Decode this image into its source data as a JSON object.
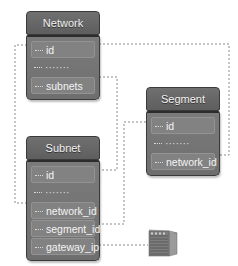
{
  "diagram": {
    "type": "entity-relationship",
    "colors": {
      "entity_fill": "#6e6e6e",
      "entity_border": "#3a3a3a",
      "text": "#f4f4f4",
      "link": "#888888",
      "background": "#ffffff"
    },
    "entities": [
      {
        "id": "network",
        "title": "Network",
        "fields": [
          "id",
          "·······",
          "subnets"
        ]
      },
      {
        "id": "segment",
        "title": "Segment",
        "fields": [
          "id",
          "·······",
          "network_id"
        ]
      },
      {
        "id": "subnet",
        "title": "Subnet",
        "fields": [
          "id",
          "·······",
          "network_id",
          "segment_id",
          "gateway_ip"
        ]
      }
    ],
    "links": [
      {
        "from": "Network.id",
        "to": "Subnet.network_id",
        "style": "dotted"
      },
      {
        "from": "Network.id",
        "to": "Segment.network_id",
        "style": "dotted"
      },
      {
        "from": "Network.subnets",
        "to": "Subnet.id",
        "style": "dotted"
      },
      {
        "from": "Segment.id",
        "to": "Subnet.segment_id",
        "style": "dotted"
      },
      {
        "from": "Subnet.gateway_ip",
        "to": "server-icon",
        "style": "dotted"
      }
    ],
    "icons": [
      "server-icon"
    ]
  }
}
